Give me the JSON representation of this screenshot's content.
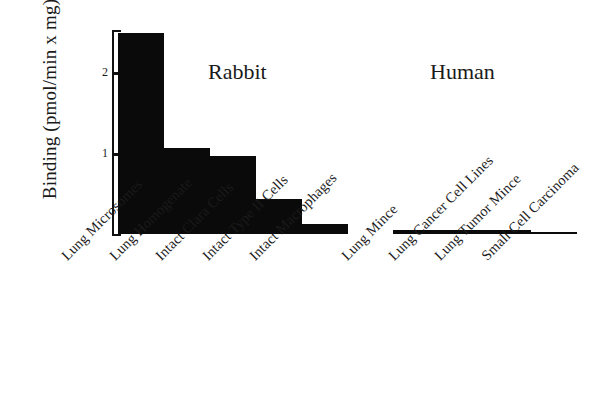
{
  "chart_data": {
    "type": "bar",
    "title": "",
    "subtitle": "",
    "xlabel": "",
    "ylabel": "Binding (pmol/min x mg)",
    "ylim": [
      0,
      2.53
    ],
    "yticks": [
      1,
      2
    ],
    "ytick_labels": [
      "1",
      "2"
    ],
    "grid": false,
    "legend": "none",
    "categories": [
      "Lung Microsomes",
      "Lung Homogenate",
      "Intact Clara Cells",
      "Intact Type II Cells",
      "Intact Macrophages",
      "Lung Mince",
      "Lung Cancer Cell Lines",
      "Lung Tumor Mince",
      "Small Cell Carcinoma"
    ],
    "values": [
      2.5,
      1.07,
      0.97,
      0.43,
      0.12,
      0.05,
      0.05,
      0.05,
      0.02
    ],
    "groups": [
      {
        "name": "Rabbit",
        "category_indices": [
          0,
          1,
          2,
          3,
          4
        ]
      },
      {
        "name": "Human",
        "category_indices": [
          5,
          6,
          7,
          8
        ]
      }
    ],
    "bar_color": "#0a0a0a",
    "axis_color": "#111111",
    "background_color": "#ffffff"
  },
  "axis": {
    "y_title": "Binding (pmol/min x mg)",
    "tick_2": "2",
    "tick_1": "1"
  },
  "groups": {
    "rabbit": "Rabbit",
    "human": "Human"
  },
  "categories": {
    "c0": "Lung Microsomes",
    "c1": "Lung Homogenate",
    "c2": "Intact Clara Cells",
    "c3": "Intact Type II Cells",
    "c4": "Intact Macrophages",
    "c5": "Lung Mince",
    "c6": "Lung Cancer Cell Lines",
    "c7": "Lung Tumor Mince",
    "c8": "Small Cell Carcinoma"
  }
}
